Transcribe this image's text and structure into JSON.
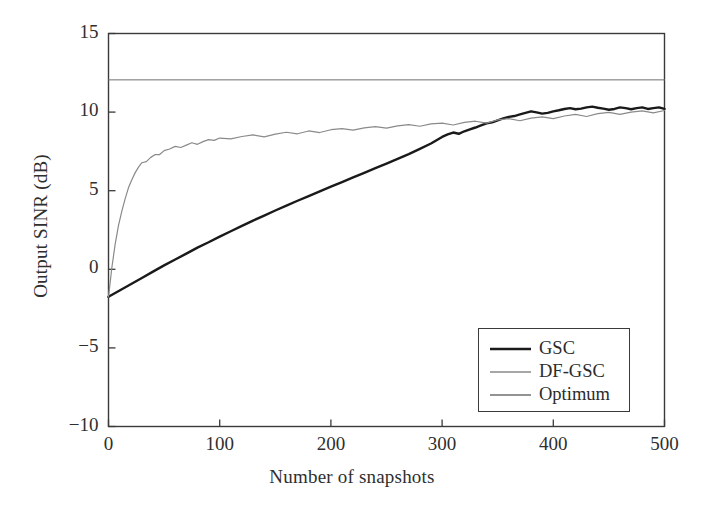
{
  "chart_data": {
    "type": "line",
    "title": "",
    "xlabel": "Number of snapshots",
    "ylabel": "Output SINR (dB)",
    "xlim": [
      0,
      500
    ],
    "ylim": [
      -10,
      15
    ],
    "xticks": [
      0,
      100,
      200,
      300,
      400,
      500
    ],
    "yticks": [
      -10,
      -5,
      0,
      5,
      10,
      15
    ],
    "xtick_labels": [
      "0",
      "100",
      "200",
      "300",
      "400",
      "500"
    ],
    "ytick_labels": [
      "−10",
      "−5",
      "0",
      "5",
      "10",
      "15"
    ],
    "grid": false,
    "legend_position": "lower right",
    "series": [
      {
        "name": "GSC",
        "color": "#1a1a1a",
        "width": 2.4,
        "x": [
          0,
          10,
          20,
          30,
          40,
          50,
          60,
          70,
          80,
          90,
          100,
          110,
          120,
          130,
          140,
          150,
          160,
          170,
          180,
          190,
          200,
          210,
          220,
          230,
          240,
          250,
          260,
          270,
          280,
          290,
          300,
          305,
          310,
          315,
          320,
          325,
          330,
          335,
          340,
          345,
          350,
          355,
          360,
          365,
          370,
          375,
          380,
          385,
          390,
          395,
          400,
          405,
          410,
          415,
          420,
          425,
          430,
          435,
          440,
          445,
          450,
          455,
          460,
          465,
          470,
          475,
          480,
          485,
          490,
          495,
          500
        ],
        "y": [
          -1.75,
          -1.35,
          -0.95,
          -0.55,
          -0.15,
          0.25,
          0.62,
          1.0,
          1.38,
          1.72,
          2.08,
          2.42,
          2.76,
          3.1,
          3.42,
          3.74,
          4.05,
          4.36,
          4.66,
          4.96,
          5.26,
          5.55,
          5.85,
          6.14,
          6.43,
          6.72,
          7.02,
          7.33,
          7.66,
          8.0,
          8.42,
          8.58,
          8.7,
          8.62,
          8.78,
          8.9,
          9.02,
          9.15,
          9.28,
          9.35,
          9.48,
          9.6,
          9.7,
          9.75,
          9.85,
          9.95,
          10.05,
          9.98,
          9.9,
          9.95,
          10.05,
          10.12,
          10.2,
          10.25,
          10.18,
          10.22,
          10.3,
          10.35,
          10.28,
          10.22,
          10.15,
          10.2,
          10.3,
          10.25,
          10.18,
          10.25,
          10.3,
          10.2,
          10.25,
          10.3,
          10.2
        ]
      },
      {
        "name": "DF-GSC",
        "color": "#8a8a8a",
        "width": 1.2,
        "x": [
          0,
          3,
          6,
          9,
          12,
          15,
          18,
          21,
          24,
          27,
          30,
          34,
          38,
          42,
          46,
          50,
          55,
          60,
          65,
          70,
          75,
          80,
          85,
          90,
          95,
          100,
          110,
          120,
          130,
          140,
          150,
          160,
          170,
          180,
          190,
          200,
          210,
          220,
          230,
          240,
          250,
          260,
          270,
          280,
          290,
          300,
          310,
          320,
          330,
          340,
          350,
          360,
          370,
          380,
          390,
          400,
          410,
          420,
          430,
          440,
          450,
          460,
          470,
          480,
          490,
          500
        ],
        "y": [
          -1.75,
          0.1,
          1.6,
          2.8,
          3.7,
          4.5,
          5.2,
          5.7,
          6.15,
          6.5,
          6.78,
          6.85,
          7.12,
          7.3,
          7.3,
          7.55,
          7.65,
          7.82,
          7.75,
          7.9,
          8.05,
          7.95,
          8.12,
          8.25,
          8.2,
          8.35,
          8.3,
          8.45,
          8.55,
          8.42,
          8.6,
          8.72,
          8.62,
          8.8,
          8.7,
          8.88,
          8.95,
          8.85,
          9.0,
          9.08,
          8.98,
          9.12,
          9.2,
          9.1,
          9.25,
          9.3,
          9.18,
          9.35,
          9.42,
          9.3,
          9.5,
          9.58,
          9.45,
          9.62,
          9.7,
          9.58,
          9.75,
          9.85,
          9.72,
          9.9,
          9.98,
          9.85,
          10.0,
          10.08,
          9.95,
          10.1
        ]
      },
      {
        "name": "Optimum",
        "color": "#6f6f6f",
        "width": 1.0,
        "x": [
          0,
          500
        ],
        "y": [
          12.05,
          12.05
        ]
      }
    ]
  },
  "legend": {
    "entries": [
      {
        "label": "GSC"
      },
      {
        "label": "DF-GSC"
      },
      {
        "label": "Optimum"
      }
    ]
  }
}
